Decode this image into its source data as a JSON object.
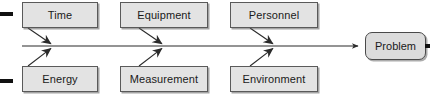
{
  "diagram": {
    "type": "fishbone-ishikawa",
    "title": "",
    "effect": {
      "label": "Problem",
      "shape": "rounded-rectangle",
      "x": 365,
      "y": 32,
      "width": 61,
      "height": 28
    },
    "spine": {
      "from_x": 22,
      "to_x": 362,
      "y": 46,
      "has_arrowhead": true
    },
    "categories_top": [
      {
        "label": "Time",
        "x": 22,
        "y": 2,
        "width": 76,
        "height": 26,
        "join_x": 55
      },
      {
        "label": "Equipment",
        "x": 120,
        "y": 2,
        "width": 88,
        "height": 26,
        "join_x": 166
      },
      {
        "label": "Personnel",
        "x": 230,
        "y": 2,
        "width": 88,
        "height": 26,
        "join_x": 277
      }
    ],
    "categories_bottom": [
      {
        "label": "Energy",
        "x": 22,
        "y": 66,
        "width": 76,
        "height": 26,
        "join_x": 55
      },
      {
        "label": "Measurement",
        "x": 120,
        "y": 66,
        "width": 88,
        "height": 26,
        "join_x": 166
      },
      {
        "label": "Environment",
        "x": 230,
        "y": 66,
        "width": 88,
        "height": 26,
        "join_x": 277
      }
    ],
    "edge_marks": [
      {
        "name": "top-left-edge-mark",
        "x": 0,
        "y": 12,
        "width": 13,
        "height": 4
      },
      {
        "name": "bottom-left-edge-mark",
        "x": 0,
        "y": 79,
        "width": 13,
        "height": 4
      },
      {
        "name": "right-edge-mark",
        "x": 425,
        "y": 44,
        "width": 5,
        "height": 4
      }
    ],
    "colors": {
      "background": "#ffffff",
      "box_fill": "#e3e3e3",
      "box_border": "#5a5a5a",
      "effect_fill": "#dcdcdc",
      "effect_border": "#4a4a4a",
      "line": "#2b2b2b",
      "text": "#1a1a1a"
    }
  }
}
